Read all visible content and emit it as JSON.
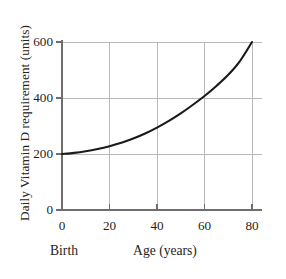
{
  "chart_data": {
    "type": "line",
    "title": "",
    "subtitle": "",
    "xlabel": "Age (years)",
    "ylabel": "Daily Vitamin D requirement (units)",
    "origin_caption": "Birth",
    "xlim": [
      0,
      80
    ],
    "ylim": [
      0,
      600
    ],
    "xticks": [
      0,
      20,
      40,
      60,
      80
    ],
    "yticks": [
      0,
      200,
      400,
      600
    ],
    "xtick_labels": [
      "0",
      "20",
      "40",
      "60",
      "80"
    ],
    "ytick_labels": [
      "0",
      "200",
      "400",
      "600"
    ],
    "grid": true,
    "grid_color": "#b9b9b9",
    "axis_color": "#6e6e6e",
    "legend": null,
    "legend_position": "none",
    "series": [
      {
        "name": "Daily Vitamin D requirement",
        "color": "#1a1a1a",
        "line_width": 2.1,
        "x": [
          0,
          5,
          10,
          15,
          20,
          25,
          30,
          35,
          40,
          45,
          50,
          55,
          60,
          65,
          70,
          75,
          80
        ],
        "y": [
          200,
          204,
          210,
          218,
          228,
          240,
          255,
          273,
          294,
          318,
          345,
          375,
          407,
          443,
          483,
          533,
          600
        ]
      }
    ],
    "annotations": []
  },
  "geometry": {
    "plot_left": 62,
    "plot_right": 252,
    "plot_top": 42,
    "plot_bottom": 210,
    "grid_overhang_right": 10,
    "tick_length": 6
  }
}
